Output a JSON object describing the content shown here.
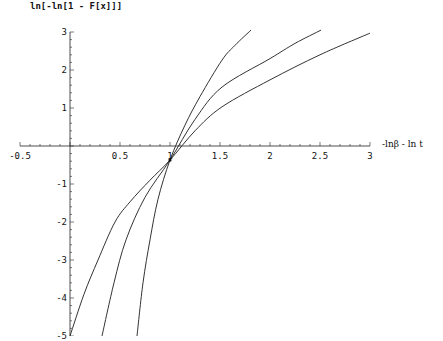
{
  "chart_data": {
    "type": "line",
    "title": "",
    "xlabel": "-lnβ - ln t",
    "ylabel": "ln[-ln[1 - F[x]]]",
    "xlim": [
      -0.5,
      3.0
    ],
    "ylim": [
      -5,
      3
    ],
    "grid": false,
    "legend": null,
    "x_ticks": [
      -0.5,
      0.5,
      1,
      1.5,
      2,
      2.5,
      3
    ],
    "x_tick_labels": [
      "-0.5",
      "0.5",
      "1",
      "1.5",
      "2",
      "2.5",
      "3"
    ],
    "y_ticks": [
      -5,
      -4,
      -3,
      -2,
      -1,
      1,
      2,
      3
    ],
    "y_tick_labels": [
      "-5",
      "-4",
      "-3",
      "-2",
      "-1",
      "1",
      "2",
      "3"
    ],
    "annotations": [
      "all three curves intersect near (1, -0.37)"
    ],
    "series": [
      {
        "name": "steep curve",
        "x": [
          0.67,
          0.73,
          0.8,
          0.88,
          1.0,
          1.15,
          1.3,
          1.52,
          1.65,
          1.81
        ],
        "y": [
          -5.0,
          -3.6,
          -2.47,
          -1.4,
          -0.37,
          0.55,
          1.3,
          2.26,
          2.65,
          3.05
        ]
      },
      {
        "name": "medium curve",
        "x": [
          0.32,
          0.44,
          0.56,
          0.75,
          1.0,
          1.25,
          1.52,
          2.0,
          2.25,
          2.51
        ],
        "y": [
          -5.0,
          -3.6,
          -2.47,
          -1.35,
          -0.37,
          0.7,
          1.55,
          2.3,
          2.7,
          3.05
        ]
      },
      {
        "name": "shallow curve",
        "x": [
          0.0,
          0.14,
          0.28,
          0.45,
          0.6,
          0.8,
          1.0,
          1.25,
          1.52,
          2.0,
          2.5,
          3.0
        ],
        "y": [
          -5.0,
          -3.9,
          -3.0,
          -2.0,
          -1.47,
          -0.9,
          -0.37,
          0.4,
          1.03,
          1.74,
          2.4,
          2.97
        ]
      }
    ]
  },
  "axes": {
    "y_label": "ln[-ln[1 - F[x]]]",
    "x_label": "-lnβ - ln t"
  }
}
